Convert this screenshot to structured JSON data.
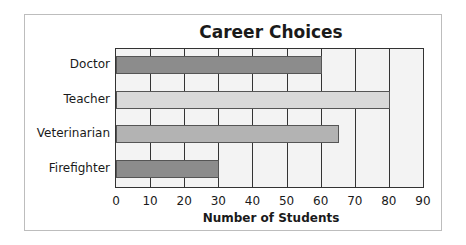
{
  "chart_data": {
    "type": "bar",
    "orientation": "horizontal",
    "title": "Career Choices",
    "xlabel": "Number of Students",
    "ylabel": "",
    "categories": [
      "Doctor",
      "Teacher",
      "Veterinarian",
      "Firefighter"
    ],
    "values": [
      60,
      80,
      65,
      30
    ],
    "xlim": [
      0,
      90
    ],
    "xticks": [
      "0",
      "10",
      "20",
      "30",
      "40",
      "50",
      "60",
      "70",
      "80",
      "90"
    ],
    "grid": true,
    "legend": null,
    "bar_colors": [
      "#8c8c8c",
      "#d9d9d9",
      "#b3b3b3",
      "#8c8c8c"
    ]
  }
}
